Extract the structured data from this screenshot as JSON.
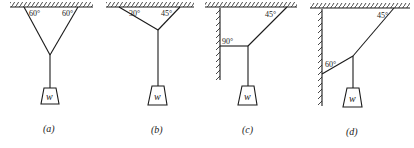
{
  "figure": {
    "panels": [
      {
        "id": "a",
        "caption": "(a)",
        "angles": [
          "60°",
          "60°"
        ],
        "weight_label": "w"
      },
      {
        "id": "b",
        "caption": "(b)",
        "angles": [
          "30°",
          "45°"
        ],
        "weight_label": "w"
      },
      {
        "id": "c",
        "caption": "(c)",
        "angles": [
          "90°",
          "45°"
        ],
        "weight_label": "w"
      },
      {
        "id": "d",
        "caption": "(d)",
        "angles": [
          "60°",
          "45°"
        ],
        "weight_label": "w"
      }
    ]
  }
}
